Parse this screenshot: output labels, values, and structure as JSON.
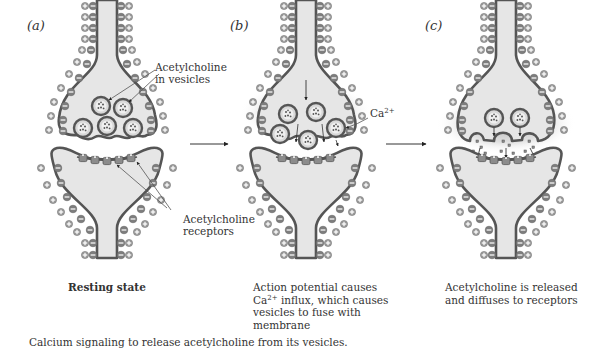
{
  "colors": {
    "membrane": "#555555",
    "cytoplasm": "#e6e6e6",
    "ion_fill": "#8a8a8a",
    "ion_outline": "#777777",
    "receptor": "#8c8c8c",
    "calcium_glow": "#b5b5b5",
    "text": "#333333",
    "background": "#ffffff"
  },
  "panels": [
    {
      "id": "a",
      "label": "(a)",
      "caption_line1": "Resting state",
      "annotations": {
        "vesicles_line1": "Acetylcholine",
        "vesicles_line2": "in vesicles",
        "receptors_line1": "Acetylcholine",
        "receptors_line2": "receptors"
      }
    },
    {
      "id": "b",
      "label": "(b)",
      "caption_line1": "Action potential causes",
      "caption_line2_pre": "Ca",
      "caption_line2_sup": "2+",
      "caption_line2_post": " influx, which causes",
      "caption_line3": "vesicles to fuse with",
      "caption_line4": "membrane",
      "annotations": {
        "ion_base": "Ca",
        "ion_sup": "2+"
      }
    },
    {
      "id": "c",
      "label": "(c)",
      "caption_line1": "Acetylcholine is released",
      "caption_line2": "and diffuses to receptors"
    }
  ],
  "figure_caption": "Calcium signaling to release acetylcholine from its vesicles."
}
